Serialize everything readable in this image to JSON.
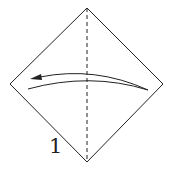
{
  "diagram": {
    "type": "origami-step",
    "step_number": "1",
    "paper": {
      "shape": "square rotated as diamond",
      "top": [
        87,
        8
      ],
      "right": [
        163,
        84
      ],
      "bottom": [
        87,
        162
      ],
      "left": [
        10,
        84
      ]
    },
    "crease": {
      "style": "dashed valley fold",
      "from": [
        87,
        8
      ],
      "to": [
        87,
        162
      ]
    },
    "arrow": {
      "direction": "right-to-left",
      "meaning": "fold right half over to the left"
    },
    "colors": {
      "line": "#222222",
      "background": "#ffffff"
    }
  }
}
